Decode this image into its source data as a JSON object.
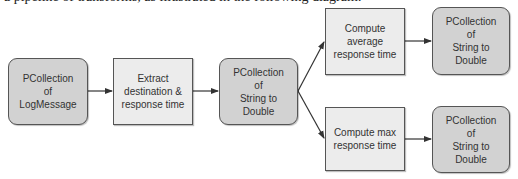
{
  "caption": "a pipeline of transforms, as illustrated in the following diagram:",
  "colors": {
    "pcollection_fill": "#d2d2d2",
    "transform_fill": "#ececec",
    "border": "#555555",
    "edge": "#333333"
  },
  "nodes": [
    {
      "id": "n1",
      "type": "pcollection",
      "label": "PCollection\nof\nLogMessage"
    },
    {
      "id": "n2",
      "type": "transform",
      "label": "Extract\ndestination &\nresponse time"
    },
    {
      "id": "n3",
      "type": "pcollection",
      "label": "PCollection\nof\nString to\nDouble"
    },
    {
      "id": "n4",
      "type": "transform",
      "label": "Compute\naverage\nresponse time"
    },
    {
      "id": "n5",
      "type": "pcollection",
      "label": "PCollection\nof\nString to\nDouble"
    },
    {
      "id": "n6",
      "type": "transform",
      "label": "Compute max\nresponse time"
    },
    {
      "id": "n7",
      "type": "pcollection",
      "label": "PCollection\nof\nString to\nDouble"
    }
  ],
  "edges": [
    {
      "from": "n1",
      "to": "n2"
    },
    {
      "from": "n2",
      "to": "n3"
    },
    {
      "from": "n3",
      "to": "n4"
    },
    {
      "from": "n3",
      "to": "n6"
    },
    {
      "from": "n4",
      "to": "n5"
    },
    {
      "from": "n6",
      "to": "n7"
    }
  ]
}
